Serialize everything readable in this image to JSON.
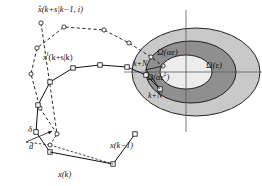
{
  "figure": {
    "width": 262,
    "height": 186,
    "background": "#ffffff"
  },
  "colors": {
    "stroke": "#111111",
    "outer_ellipse_fill": "#c9c9c9",
    "middle_ellipse_fill": "#8f8f8f",
    "inner_ellipse_fill": "#ededed",
    "marker_fill": "#ffffff",
    "axis": "#5a5a5a"
  },
  "labels": {
    "predicted_trajectory": "x̂(k+s|k−1, i)",
    "feasible_trajectory_base": "x",
    "feasible_trajectory_sup": "f",
    "feasible_trajectory_rest": "(k+s|k)",
    "omega_alpha_eps": "Ω(αε)",
    "omega_eps": "Ω(ε)",
    "omega_alpha_eps_sq_base": "Ω(αε",
    "omega_alpha_eps_sq_sup": "2",
    "omega_alpha_eps_sq_close": ")",
    "horizon_upper": "k+N",
    "horizon_lower": "k+N",
    "delta": "δ",
    "d": "d",
    "state_k": "x(k)",
    "state_k_minus_1": "x(k−1)"
  },
  "ellipsoids": [
    {
      "name": "omega-eps",
      "label": "Ω(ε)",
      "cx": 196,
      "cy": 72,
      "rx": 64,
      "ry": 44,
      "fill": "#c9c9c9"
    },
    {
      "name": "omega-alpha-eps",
      "label": "Ω(αε)",
      "cx": 191,
      "cy": 72,
      "rx": 45,
      "ry": 31,
      "fill": "#8f8f8f"
    },
    {
      "name": "omega-alpha-eps-sq",
      "label": "Ω(αε²)",
      "cx": 186,
      "cy": 72,
      "rx": 26,
      "ry": 17,
      "fill": "#ededed"
    }
  ],
  "axes": {
    "horizontal": {
      "x1": 124,
      "y1": 72,
      "x2": 262,
      "y2": 72
    },
    "vertical": {
      "x1": 186,
      "y1": 10,
      "x2": 186,
      "y2": 132
    }
  },
  "trajectories": [
    {
      "name": "predicted-trajectory-dashed",
      "style": "dashed",
      "marker": "circle",
      "points": [
        [
          41,
          23
        ],
        [
          57,
          134
        ],
        [
          40,
          108
        ],
        [
          31,
          74
        ],
        [
          37,
          48
        ],
        [
          64,
          27
        ],
        [
          104,
          30
        ],
        [
          129,
          43
        ],
        [
          151,
          57
        ],
        [
          163,
          66
        ]
      ]
    },
    {
      "name": "feasible-trajectory-solid",
      "style": "solid",
      "marker": "square",
      "points": [
        [
          50,
          152
        ],
        [
          36,
          132
        ],
        [
          38,
          105
        ],
        [
          50,
          82
        ],
        [
          73,
          68
        ],
        [
          100,
          65
        ],
        [
          127,
          67
        ],
        [
          146,
          75
        ],
        [
          160,
          89
        ]
      ]
    },
    {
      "name": "measured-state-path",
      "style": "solid",
      "marker": "square",
      "points": [
        [
          50,
          152
        ],
        [
          113,
          164
        ],
        [
          135,
          134
        ]
      ]
    }
  ],
  "annotations": {
    "delta_segment": {
      "from": [
        26,
        142
      ],
      "to": [
        52,
        131
      ]
    },
    "d_segment": {
      "from": [
        26,
        142
      ],
      "to": [
        50,
        145
      ]
    }
  }
}
